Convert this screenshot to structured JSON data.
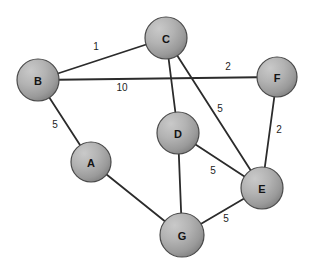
{
  "figure": {
    "background_color": "#ffffff",
    "width": 319,
    "height": 272
  },
  "style": {
    "node_fill_light": "#b9b9b9",
    "node_fill_dark": "#8c8c8c",
    "node_stroke": "#4a4a4a",
    "edge_stroke": "#2b2b2b",
    "label_color": "#141414",
    "weight_color": "#1d1d1d"
  },
  "chart_data": {
    "type": "diagram",
    "graph_kind": "undirected-weighted",
    "node_radius": 20,
    "nodes": [
      {
        "id": "A",
        "label": "A",
        "x": 91,
        "y": 162,
        "r": 20
      },
      {
        "id": "B",
        "label": "B",
        "x": 38,
        "y": 80,
        "r": 21
      },
      {
        "id": "C",
        "label": "C",
        "x": 166,
        "y": 38,
        "r": 21
      },
      {
        "id": "D",
        "label": "D",
        "x": 178,
        "y": 133,
        "r": 21
      },
      {
        "id": "E",
        "label": "E",
        "x": 262,
        "y": 188,
        "r": 21
      },
      {
        "id": "F",
        "label": "F",
        "x": 277,
        "y": 77,
        "r": 20
      },
      {
        "id": "G",
        "label": "G",
        "x": 182,
        "y": 235,
        "r": 22
      }
    ],
    "edges": [
      {
        "source": "B",
        "target": "C",
        "weight": 1,
        "label": "1",
        "label_x": 96,
        "label_y": 46
      },
      {
        "source": "B",
        "target": "F",
        "weight": 10,
        "label": "10",
        "label_x": 122,
        "label_y": 87
      },
      {
        "source": "B",
        "target": "F",
        "weight": 2,
        "label": "2",
        "label_x": 228,
        "label_y": 66
      },
      {
        "source": "B",
        "target": "A",
        "weight": 5,
        "label": "5",
        "label_x": 55,
        "label_y": 124
      },
      {
        "source": "C",
        "target": "D",
        "weight": null,
        "label": "",
        "label_x": 0,
        "label_y": 0
      },
      {
        "source": "C",
        "target": "E",
        "weight": 5,
        "label": "5",
        "label_x": 220,
        "label_y": 108
      },
      {
        "source": "F",
        "target": "E",
        "weight": 2,
        "label": "2",
        "label_x": 279,
        "label_y": 129
      },
      {
        "source": "D",
        "target": "E",
        "weight": 5,
        "label": "5",
        "label_x": 213,
        "label_y": 170
      },
      {
        "source": "D",
        "target": "G",
        "weight": null,
        "label": "",
        "label_x": 0,
        "label_y": 0
      },
      {
        "source": "A",
        "target": "G",
        "weight": null,
        "label": "",
        "label_x": 0,
        "label_y": 0
      },
      {
        "source": "G",
        "target": "E",
        "weight": 5,
        "label": "5",
        "label_x": 226,
        "label_y": 218
      }
    ],
    "edge_labels": [
      "1",
      "10",
      "2",
      "5",
      "5",
      "2",
      "5",
      "5"
    ],
    "node_labels": [
      "A",
      "B",
      "C",
      "D",
      "E",
      "F",
      "G"
    ]
  }
}
